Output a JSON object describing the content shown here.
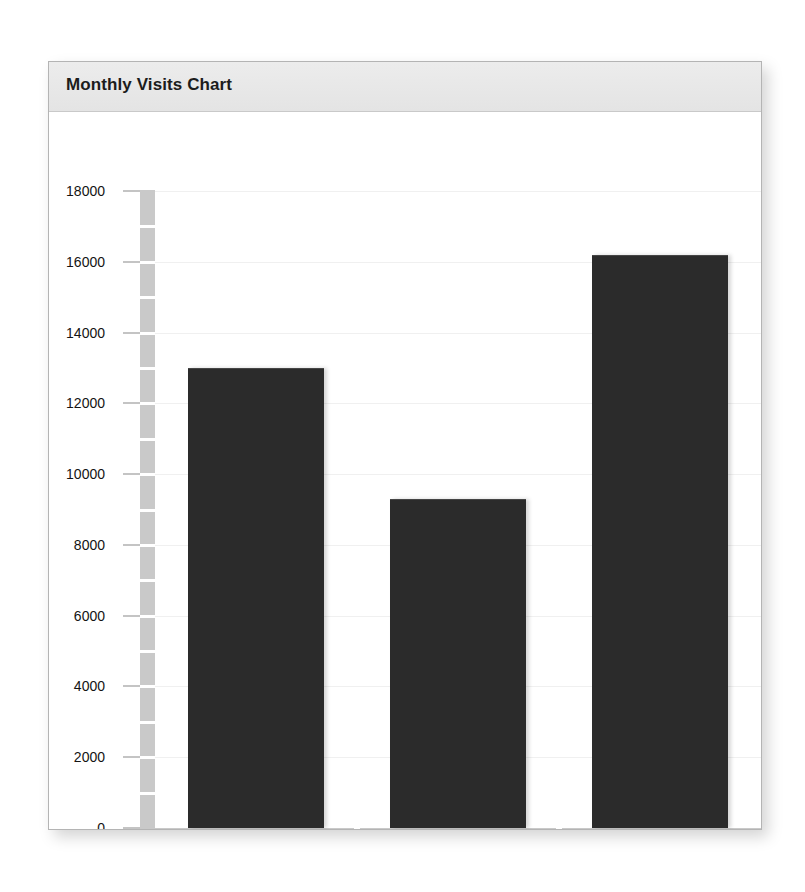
{
  "panel": {
    "title": "Monthly Visits Chart"
  },
  "chart_data": {
    "type": "bar",
    "title": "Monthly Visits Chart",
    "xlabel": "",
    "ylabel": "",
    "categories": [
      "site1.com",
      "site2.com",
      "site3.com"
    ],
    "values": [
      13000,
      9300,
      16200
    ],
    "series": [
      {
        "name": "Monthly Visits",
        "values": [
          13000,
          9300,
          16200
        ]
      }
    ],
    "ylim": [
      0,
      18000
    ],
    "yticks": [
      0,
      2000,
      4000,
      6000,
      8000,
      10000,
      12000,
      14000,
      16000,
      18000
    ],
    "ytick_labels": [
      "0",
      "2000",
      "4000",
      "6000",
      "8000",
      "10000",
      "12000",
      "14000",
      "16000",
      "18000"
    ],
    "grid": true,
    "legend": false,
    "bar_color": "#2b2b2b",
    "axis_color": "#c9c9c9",
    "gridline_color": "#f0f0f0",
    "header_color": "#e8e8e8",
    "panel_border_color": "#b4b4b4",
    "background": "#ffffff"
  }
}
